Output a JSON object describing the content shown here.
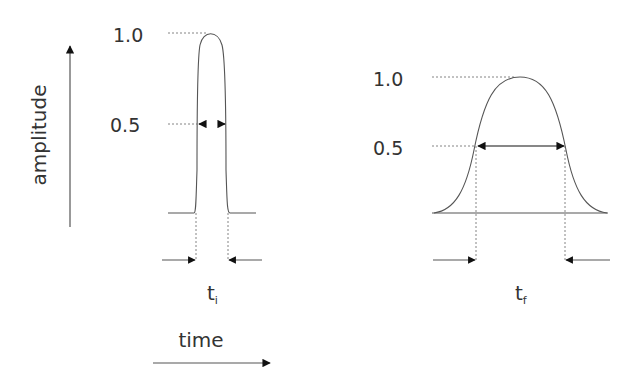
{
  "diagram": {
    "axes": {
      "y_label": "amplitude",
      "x_label": "time"
    },
    "pulses": [
      {
        "name": "initial",
        "label_main": "t",
        "label_sub": "i",
        "tick_max": "1.0",
        "tick_half": "0.5",
        "shape": "narrow"
      },
      {
        "name": "final",
        "label_main": "t",
        "label_sub": "f",
        "tick_max": "1.0",
        "tick_half": "0.5",
        "shape": "broad"
      }
    ],
    "colors": {
      "line": "#555555",
      "text": "#333333",
      "arrow": "#111111"
    }
  }
}
